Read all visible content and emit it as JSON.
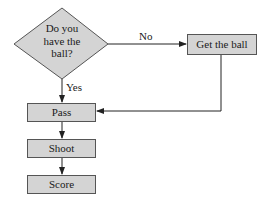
{
  "diagram": {
    "type": "flowchart",
    "decision": {
      "text_lines": [
        "Do you",
        "have the",
        "ball?"
      ]
    },
    "edges": {
      "no_label": "No",
      "yes_label": "Yes"
    },
    "nodes": {
      "get_ball": "Get the ball",
      "pass": "Pass",
      "shoot": "Shoot",
      "score": "Score"
    },
    "colors": {
      "fill": "#d4d4d4",
      "stroke": "#555555",
      "line": "#222222"
    }
  }
}
